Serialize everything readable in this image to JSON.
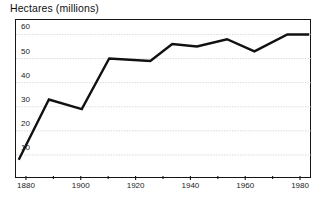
{
  "chart_data": {
    "type": "line",
    "title": "Hectares (millions)",
    "xlabel": "",
    "ylabel": "Hectares (millions)",
    "xlim": [
      1876,
      1984
    ],
    "ylim": [
      0,
      66
    ],
    "grid": true,
    "legend": "none",
    "y_ticks": [
      10,
      20,
      30,
      40,
      50,
      60
    ],
    "x_ticks_major": [
      1880,
      1900,
      1920,
      1940,
      1960,
      1980
    ],
    "x_ticks_minor": [
      1890,
      1910,
      1930,
      1950,
      1970
    ],
    "series": [
      {
        "name": "Hectares",
        "color": "#111111",
        "x": [
          1877,
          1888,
          1900,
          1910,
          1925,
          1933,
          1942,
          1953,
          1963,
          1975,
          1983
        ],
        "values": [
          8,
          33,
          29,
          50,
          49,
          56,
          55,
          58,
          53,
          60,
          60
        ]
      }
    ]
  },
  "axis": {
    "y_tick_labels": [
      "60",
      "50",
      "40",
      "30",
      "20",
      "10"
    ],
    "x_tick_labels": [
      "1880",
      "1900",
      "1920",
      "1940",
      "1960",
      "1980"
    ]
  },
  "colors": {
    "line": "#111111",
    "frame": "#141414",
    "grid": "#d8d8d8",
    "background": "#ffffff",
    "text": "#1b1b1b"
  }
}
